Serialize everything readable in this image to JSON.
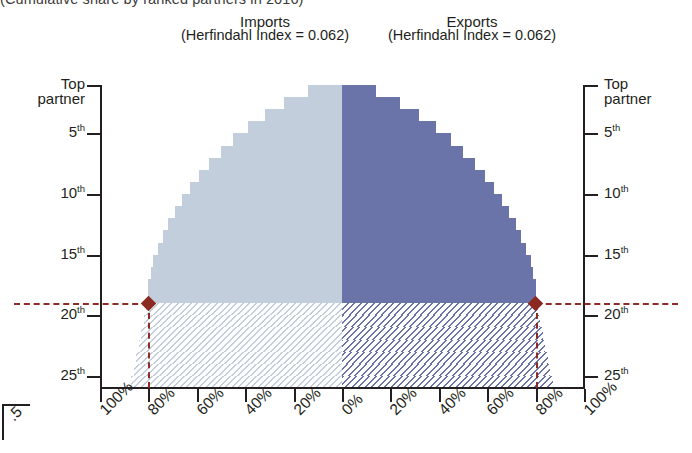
{
  "subtitle": "(Cumulative share by ranked partners in 2016)",
  "panels": {
    "imports": {
      "title": "Imports",
      "index_label": "(Herfindahl Index = 0.062)"
    },
    "exports": {
      "title": "Exports",
      "index_label": "(Herfindahl Index = 0.062)"
    }
  },
  "axes": {
    "y_left_label": "Top\npartner",
    "y_ticks": [
      "Top partner",
      "5",
      "10",
      "15",
      "20",
      "25"
    ],
    "y_tick_labels": [
      "Top partner",
      "5th",
      "10th",
      "15th",
      "20th",
      "25th"
    ],
    "x_tick_labels": [
      "100%",
      "80%",
      "60%",
      "40%",
      "20%",
      "0%",
      "20%",
      "40%",
      "60%",
      "80%",
      "100%"
    ]
  },
  "markers": {
    "imports": {
      "share": "80%",
      "rank": "18th"
    },
    "exports": {
      "share": "80%",
      "rank": "18th"
    }
  },
  "fragment": {
    "text": ".5"
  },
  "colors": {
    "imports_fill": "#c3cedd",
    "exports_fill": "#6b74a8",
    "marker": "#8a2a22",
    "axis": "#231f20"
  },
  "chart_data": {
    "type": "bar",
    "title": "",
    "subtitle": "(Cumulative share by ranked partners in 2016)",
    "xlabel": "Cumulative share (%)",
    "ylabel": "Partner rank",
    "grid": false,
    "legend": "none",
    "orientation": "horizontal-mirrored",
    "xlim": [
      0,
      100
    ],
    "ylim": [
      1,
      25
    ],
    "center_value": 0,
    "categories": [
      "Top partner",
      "2nd",
      "3rd",
      "4th",
      "5th",
      "6th",
      "7th",
      "8th",
      "9th",
      "10th",
      "11th",
      "12th",
      "13th",
      "14th",
      "15th",
      "16th",
      "17th",
      "18th",
      "19th",
      "20th",
      "21st",
      "22nd",
      "23rd",
      "24th",
      "25th"
    ],
    "series": [
      {
        "name": "Imports",
        "direction": "left",
        "herfindahl_index": 0.062,
        "values": [
          14,
          24,
          32,
          39,
          45,
          50,
          55,
          59,
          63,
          66,
          69,
          72,
          74,
          76,
          78,
          79,
          80,
          80,
          81,
          82,
          83,
          84,
          85,
          86,
          87
        ]
      },
      {
        "name": "Exports",
        "direction": "right",
        "herfindahl_index": 0.062,
        "values": [
          14,
          24,
          32,
          39,
          45,
          50,
          55,
          59,
          63,
          66,
          69,
          72,
          74,
          76,
          78,
          79,
          80,
          80,
          81,
          82,
          83,
          84,
          85,
          86,
          87
        ]
      }
    ],
    "annotations": [
      {
        "label": "80% of imports reached at 18th partner",
        "x": 80,
        "y": 18,
        "side": "left",
        "marker": "diamond"
      },
      {
        "label": "80% of exports reached at 18th partner",
        "x": 80,
        "y": 18,
        "side": "right",
        "marker": "diamond"
      }
    ]
  }
}
